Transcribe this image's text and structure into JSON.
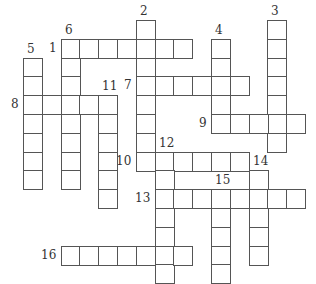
{
  "puzzle": {
    "type": "crossword",
    "cell_size": 18.8,
    "origin": {
      "x": 23,
      "y": 20
    },
    "entries": [
      {
        "number": "1",
        "dir": "across",
        "row": 1,
        "col": 2,
        "length": 7,
        "label_pos": "left"
      },
      {
        "number": "2",
        "dir": "down",
        "row": 0,
        "col": 6,
        "length": 8,
        "label_pos": "top"
      },
      {
        "number": "3",
        "dir": "down",
        "row": 0,
        "col": 13,
        "length": 7,
        "label_pos": "top"
      },
      {
        "number": "4",
        "dir": "down",
        "row": 1,
        "col": 10,
        "length": 5,
        "label_pos": "top"
      },
      {
        "number": "5",
        "dir": "down",
        "row": 2,
        "col": 0,
        "length": 7,
        "label_pos": "top"
      },
      {
        "number": "6",
        "dir": "down",
        "row": 1,
        "col": 2,
        "length": 8,
        "label_pos": "top"
      },
      {
        "number": "7",
        "dir": "across",
        "row": 3,
        "col": 6,
        "length": 6,
        "label_pos": "left"
      },
      {
        "number": "8",
        "dir": "across",
        "row": 4,
        "col": 0,
        "length": 5,
        "label_pos": "left"
      },
      {
        "number": "9",
        "dir": "across",
        "row": 5,
        "col": 10,
        "length": 5,
        "label_pos": "left"
      },
      {
        "number": "10",
        "dir": "across",
        "row": 7,
        "col": 6,
        "length": 6,
        "label_pos": "left"
      },
      {
        "number": "11",
        "dir": "down",
        "row": 4,
        "col": 4,
        "length": 6,
        "label_pos": "top"
      },
      {
        "number": "12",
        "dir": "down",
        "row": 7,
        "col": 7,
        "length": 7,
        "label_pos": "top"
      },
      {
        "number": "13",
        "dir": "across",
        "row": 9,
        "col": 7,
        "length": 8,
        "label_pos": "left"
      },
      {
        "number": "14",
        "dir": "down",
        "row": 8,
        "col": 12,
        "length": 5,
        "label_pos": "top"
      },
      {
        "number": "15",
        "dir": "down",
        "row": 9,
        "col": 10,
        "length": 5,
        "label_pos": "top"
      },
      {
        "number": "16",
        "dir": "across",
        "row": 12,
        "col": 2,
        "length": 7,
        "label_pos": "left"
      }
    ]
  }
}
